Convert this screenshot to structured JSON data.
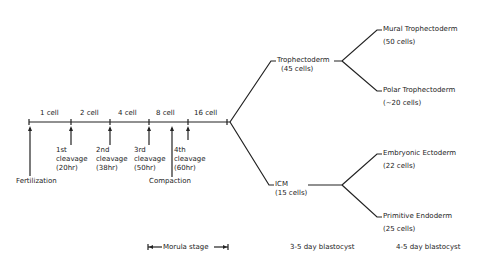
{
  "timeline": {
    "stages": [
      "1 cell",
      "2 cell",
      "4 cell",
      "8 cell",
      "16 cell"
    ],
    "events": [
      {
        "label": "Fertilization"
      },
      {
        "label": "1st\ncleavage\n(20hr)",
        "line1": "1st",
        "line2": "cleavage",
        "line3": "(20hr)"
      },
      {
        "label": "2nd\ncleavage\n(38hr)",
        "line1": "2nd",
        "line2": "cleavage",
        "line3": "(38hr)"
      },
      {
        "label": "3rd\ncleavage\n(50hr)",
        "line1": "3rd",
        "line2": "cleavage",
        "line3": "(50hr)"
      },
      {
        "label": "4th\ncleavage\n(60hr)",
        "line1": "4th",
        "line2": "cleavage",
        "line3": "(60hr)"
      },
      {
        "label": "Compaction"
      }
    ]
  },
  "lineage": {
    "trophectoderm": {
      "name": "Trophectoderm",
      "cells": "(45 cells)"
    },
    "icm": {
      "name": "ICM",
      "cells": "(15 cells)"
    },
    "mural": {
      "name": "Mural Trophectoderm",
      "cells": "(50 cells)"
    },
    "polar": {
      "name": "Polar Trophectoderm",
      "cells": "(~20 cells)"
    },
    "ectoderm": {
      "name": "Embryonic Ectoderm",
      "cells": "(22 cells)"
    },
    "endoderm": {
      "name": "Primitive Endoderm",
      "cells": "(25 cells)"
    }
  },
  "footer": {
    "morula": "Morula stage",
    "blast1": "3-5 day blastocyst",
    "blast2": "4-5 day blastocyst"
  }
}
